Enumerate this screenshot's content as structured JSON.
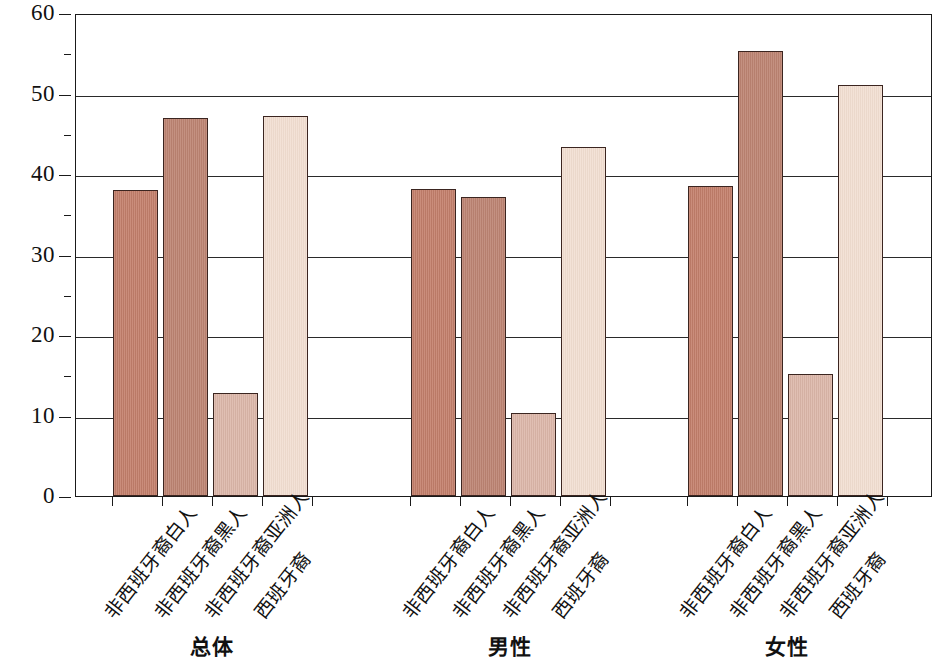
{
  "chart_data": {
    "type": "bar",
    "title": "",
    "subtitle": "",
    "xlabel": "",
    "ylabel": "百分比（%）",
    "ylim": [
      0,
      60
    ],
    "yticks": [
      0,
      10,
      20,
      30,
      40,
      50,
      60
    ],
    "ytick_labels": [
      "0",
      "10",
      "20",
      "30",
      "40",
      "50",
      "60"
    ],
    "grid": true,
    "grid_axis": "y",
    "legend": false,
    "legend_position": "none",
    "categories": [
      "非西班牙裔白人",
      "非西班牙裔黑人",
      "非西班牙裔亚洲人",
      "西班牙裔"
    ],
    "groups": [
      "总体",
      "男性",
      "女性"
    ],
    "series": [
      {
        "name": "总体",
        "values": [
          38.0,
          47.0,
          12.8,
          47.2
        ]
      },
      {
        "name": "男性",
        "values": [
          38.1,
          37.1,
          10.3,
          43.4
        ]
      },
      {
        "name": "女性",
        "values": [
          38.5,
          55.3,
          15.2,
          51.0
        ]
      }
    ],
    "colors": {
      "非西班牙裔白人": "#c4806c",
      "非西班牙裔黑人": "#bd8473",
      "非西班牙裔亚洲人": "#dcb6a9",
      "西班牙裔": "#f1ddd0",
      "bar_outline": "#3b2520",
      "axis": "#1a1a1a",
      "gridline": "#2a2a2a",
      "background": "#ffffff"
    }
  },
  "axis": {
    "y_label": "百分比（%）",
    "ticks": [
      {
        "value": 60,
        "label": "60"
      },
      {
        "value": 50,
        "label": "50"
      },
      {
        "value": 40,
        "label": "40"
      },
      {
        "value": 30,
        "label": "30"
      },
      {
        "value": 20,
        "label": "20"
      },
      {
        "value": 10,
        "label": "10"
      },
      {
        "value": 0,
        "label": "0"
      }
    ]
  },
  "groups": [
    {
      "label": "总体",
      "bars": [
        {
          "category": "非西班牙裔白人",
          "value": 38.0,
          "style": "white-ethn"
        },
        {
          "category": "非西班牙裔黑人",
          "value": 47.0,
          "style": "black-ethn"
        },
        {
          "category": "非西班牙裔亚洲人",
          "value": 12.8,
          "style": "asian-ethn"
        },
        {
          "category": "西班牙裔",
          "value": 47.2,
          "style": "hispanic-ethn"
        }
      ]
    },
    {
      "label": "男性",
      "bars": [
        {
          "category": "非西班牙裔白人",
          "value": 38.1,
          "style": "white-ethn"
        },
        {
          "category": "非西班牙裔黑人",
          "value": 37.1,
          "style": "black-ethn"
        },
        {
          "category": "非西班牙裔亚洲人",
          "value": 10.3,
          "style": "asian-ethn"
        },
        {
          "category": "西班牙裔",
          "value": 43.4,
          "style": "hispanic-ethn"
        }
      ]
    },
    {
      "label": "女性",
      "bars": [
        {
          "category": "非西班牙裔白人",
          "value": 38.5,
          "style": "white-ethn"
        },
        {
          "category": "非西班牙裔黑人",
          "value": 55.3,
          "style": "black-ethn"
        },
        {
          "category": "非西班牙裔亚洲人",
          "value": 15.2,
          "style": "asian-ethn"
        },
        {
          "category": "西班牙裔",
          "value": 51.0,
          "style": "hispanic-ethn"
        }
      ]
    }
  ]
}
